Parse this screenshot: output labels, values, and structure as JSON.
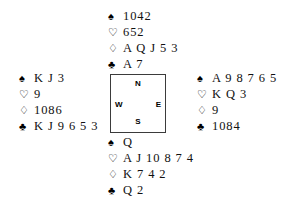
{
  "diagram": {
    "suits": {
      "spade": {
        "name": "spade-symbol",
        "glyph": "♠",
        "style": "filled"
      },
      "heart": {
        "name": "heart-symbol",
        "glyph": "♡",
        "style": "outline"
      },
      "diamond": {
        "name": "diamond-symbol",
        "glyph": "♢",
        "style": "outline"
      },
      "club": {
        "name": "club-symbol",
        "glyph": "♣",
        "style": "filled"
      }
    },
    "compass": {
      "north": "N",
      "west": "W",
      "east": "E",
      "south": "S"
    },
    "hands": {
      "north": {
        "position": "North",
        "spades": "1042",
        "hearts": "652",
        "diamonds": "A Q J 5 3",
        "clubs": "A 7"
      },
      "west": {
        "position": "West",
        "spades": "K J 3",
        "hearts": "9",
        "diamonds": "1086",
        "clubs": "K J 9 6 5 3"
      },
      "east": {
        "position": "East",
        "spades": "A 9 8 7 6 5",
        "hearts": "K Q 3",
        "diamonds": "9",
        "clubs": "1084"
      },
      "south": {
        "position": "South",
        "spades": "Q",
        "hearts": "A J 10 8 7 4",
        "diamonds": "K 7 4 2",
        "clubs": "Q 2"
      }
    }
  }
}
